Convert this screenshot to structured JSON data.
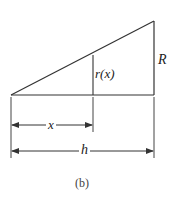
{
  "figure": {
    "caption": "(b)",
    "labels": {
      "radius_at_x": "r(x)",
      "radius": "R",
      "distance": "x",
      "height": "h"
    },
    "colors": {
      "stroke": "#333333",
      "text": "#222222",
      "background": "#ffffff"
    },
    "geometry": {
      "apex": [
        11,
        95
      ],
      "base_bottom": [
        154,
        95
      ],
      "base_top": [
        154,
        21
      ],
      "section_x": 93,
      "section_top_y": 55,
      "x_dimension_y": 125,
      "h_dimension_y": 151
    }
  }
}
